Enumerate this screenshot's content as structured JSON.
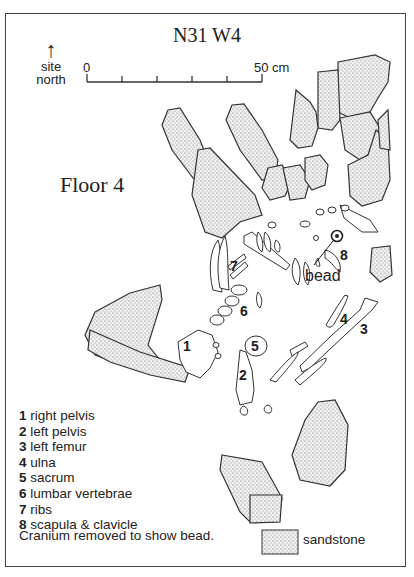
{
  "title": "N31 W4",
  "floor_label": "Floor 4",
  "north_arrow": {
    "icon": "up-arrow-icon",
    "glyph": "↑",
    "line1": "site",
    "line2": "north"
  },
  "scale_bar": {
    "start_label": "0",
    "end_label": "50 cm",
    "ticks": 5
  },
  "annotations": {
    "bead_label": "bead",
    "numbers": [
      "1",
      "2",
      "3",
      "4",
      "5",
      "6",
      "7",
      "8"
    ]
  },
  "legend": {
    "items": [
      {
        "num": "1",
        "label": "right pelvis"
      },
      {
        "num": "2",
        "label": "left pelvis"
      },
      {
        "num": "3",
        "label": "left femur"
      },
      {
        "num": "4",
        "label": "ulna"
      },
      {
        "num": "5",
        "label": "sacrum"
      },
      {
        "num": "6",
        "label": "lumbar vertebrae"
      },
      {
        "num": "7",
        "label": "ribs"
      },
      {
        "num": "8",
        "label": "scapula & clavicle"
      }
    ],
    "note": "Cranium removed to show bead.",
    "sandstone_label": "sandstone"
  },
  "colors": {
    "stone_fill": "#e6e6e6",
    "line": "#333333",
    "background": "#ffffff"
  }
}
